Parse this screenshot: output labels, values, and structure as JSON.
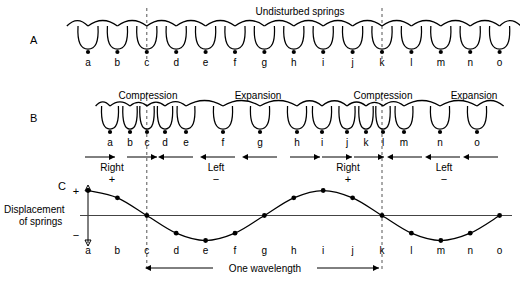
{
  "figure": {
    "title_a": "Undisturbed springs",
    "panels": [
      {
        "letter": "A",
        "name": "undisturbed"
      },
      {
        "letter": "B",
        "name": "disturbed"
      },
      {
        "letter": "C",
        "name": "displacement-graph"
      }
    ],
    "coil_labels": [
      "a",
      "b",
      "c",
      "d",
      "e",
      "f",
      "g",
      "h",
      "i",
      "j",
      "k",
      "l",
      "m",
      "n",
      "o"
    ],
    "reference_lines": [
      "c",
      "k"
    ]
  },
  "panel_a": {
    "letter": "A",
    "heading": "Undisturbed springs",
    "labels": [
      "a",
      "b",
      "c",
      "d",
      "e",
      "f",
      "g",
      "h",
      "i",
      "j",
      "k",
      "l",
      "m",
      "n",
      "o"
    ],
    "positions": [
      88,
      117.4,
      146.8,
      176.2,
      205.6,
      235,
      264.4,
      293.8,
      323.2,
      352.6,
      382,
      411.4,
      440.8,
      470.2,
      499.6
    ]
  },
  "panel_b": {
    "letter": "B",
    "region_labels": [
      {
        "text": "Compression",
        "x": 148
      },
      {
        "text": "Expansion",
        "x": 258
      },
      {
        "text": "Compression",
        "x": 383
      },
      {
        "text": "Expansion",
        "x": 474
      }
    ],
    "labels": [
      "a",
      "b",
      "c",
      "d",
      "e",
      "f",
      "g",
      "h",
      "i",
      "j",
      "k",
      "l",
      "m",
      "n",
      "o"
    ],
    "positions": [
      110,
      130,
      147,
      165,
      186,
      223,
      260,
      297,
      322,
      347,
      366,
      383,
      404,
      440,
      477
    ],
    "direction_groups": [
      {
        "label": "Right",
        "sign": "+",
        "arrow": "right",
        "label_x": 112,
        "sign_x": 112,
        "arrow_starts": [
          85,
          127
        ],
        "arrow_len": 30
      },
      {
        "label": "Left",
        "sign": "−",
        "arrow": "left",
        "label_x": 216,
        "sign_x": 216,
        "arrow_starts": [
          163,
          205,
          247
        ],
        "arrow_len": 30
      },
      {
        "label": "Right",
        "sign": "+",
        "arrow": "right",
        "label_x": 348,
        "sign_x": 348,
        "arrow_starts": [
          290,
          322,
          354
        ],
        "arrow_len": 30
      },
      {
        "label": "Left",
        "sign": "−",
        "arrow": "left",
        "label_x": 444,
        "sign_x": 444,
        "arrow_starts": [
          392,
          430,
          468
        ],
        "arrow_len": 30
      }
    ]
  },
  "panel_c": {
    "letter": "C",
    "axis_title_line1": "Displacement",
    "axis_title_line2": "of springs",
    "axis_plus": "+",
    "axis_minus": "−",
    "labels": [
      "a",
      "b",
      "c",
      "d",
      "e",
      "f",
      "g",
      "h",
      "i",
      "j",
      "k",
      "l",
      "m",
      "n",
      "o"
    ],
    "wavelength_label": "One wavelength",
    "wavelength_from": "c",
    "wavelength_to": "k"
  },
  "chart_data": {
    "type": "line",
    "xlabel": "",
    "ylabel": "Displacement of springs",
    "categories": [
      "a",
      "b",
      "c",
      "d",
      "e",
      "f",
      "g",
      "h",
      "i",
      "j",
      "k",
      "l",
      "m",
      "n",
      "o"
    ],
    "values": [
      1.0,
      0.707,
      0.0,
      -0.707,
      -1.0,
      -0.707,
      0.0,
      0.707,
      1.0,
      0.707,
      0.0,
      -0.707,
      -1.0,
      -0.707,
      0.0
    ],
    "ylim": [
      -1.15,
      1.15
    ],
    "grid": false,
    "legend": "none",
    "markers": true,
    "annotations": [
      {
        "text": "One wavelength",
        "from": "c",
        "to": "k"
      },
      {
        "text": "+",
        "position": "y-axis-top"
      },
      {
        "text": "−",
        "position": "y-axis-bottom"
      }
    ]
  }
}
